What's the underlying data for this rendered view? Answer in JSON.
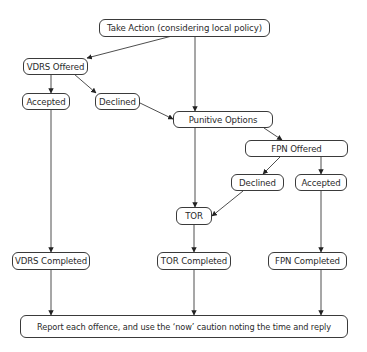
{
  "diagram": {
    "type": "flowchart",
    "nodes": {
      "take_action": "Take Action (considering local policy)",
      "vdrs_offered": "VDRS Offered",
      "vdrs_accepted": "Accepted",
      "vdrs_declined": "Declined",
      "punitive_options": "Punitive Options",
      "fpn_offered": "FPN Offered",
      "fpn_declined": "Declined",
      "fpn_accepted": "Accepted",
      "tor": "TOR",
      "vdrs_completed": "VDRS Completed",
      "tor_completed": "TOR Completed",
      "fpn_completed": "FPN Completed",
      "report": "Report each offence, and use the ‘now’ caution noting the time and reply"
    },
    "edges": [
      {
        "from": "take_action",
        "to": "vdrs_offered"
      },
      {
        "from": "take_action",
        "to": "punitive_options"
      },
      {
        "from": "vdrs_offered",
        "to": "vdrs_accepted"
      },
      {
        "from": "vdrs_offered",
        "to": "vdrs_declined"
      },
      {
        "from": "vdrs_declined",
        "to": "punitive_options"
      },
      {
        "from": "punitive_options",
        "to": "fpn_offered"
      },
      {
        "from": "punitive_options",
        "to": "tor"
      },
      {
        "from": "fpn_offered",
        "to": "fpn_declined"
      },
      {
        "from": "fpn_offered",
        "to": "fpn_accepted"
      },
      {
        "from": "fpn_declined",
        "to": "tor"
      },
      {
        "from": "vdrs_accepted",
        "to": "vdrs_completed"
      },
      {
        "from": "tor",
        "to": "tor_completed"
      },
      {
        "from": "fpn_accepted",
        "to": "fpn_completed"
      },
      {
        "from": "vdrs_completed",
        "to": "report"
      },
      {
        "from": "tor_completed",
        "to": "report"
      },
      {
        "from": "fpn_completed",
        "to": "report"
      }
    ],
    "colors": {
      "line": "#3a3a3a",
      "background": "#ffffff"
    }
  }
}
